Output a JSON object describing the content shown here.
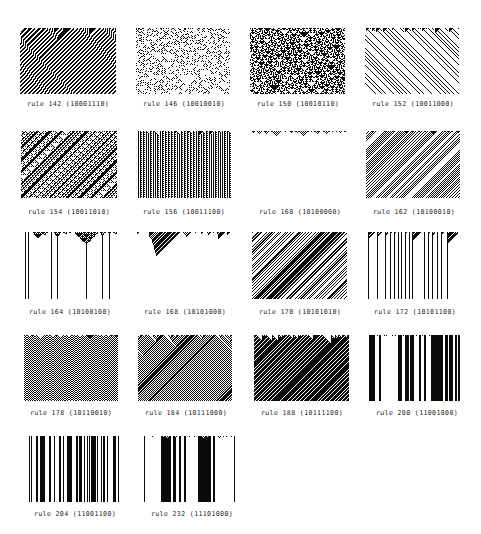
{
  "figure": {
    "panels": [
      {
        "rule": 142,
        "label": "rule 142 (10001110)",
        "style": "normal"
      },
      {
        "rule": 146,
        "label": "rule 146 (10010010)",
        "style": "sparse-chaos"
      },
      {
        "rule": 150,
        "label": "rule 150 (10010110)",
        "style": "normal"
      },
      {
        "rule": 152,
        "label": "rule 152 (10011000)",
        "style": "normal"
      },
      {
        "rule": 154,
        "label": "rule 154 (10011010)",
        "style": "normal"
      },
      {
        "rule": 156,
        "label": "rule 156 (10011100)",
        "style": "normal"
      },
      {
        "rule": 160,
        "label": "rule 160 (10100000)",
        "style": "normal"
      },
      {
        "rule": 162,
        "label": "rule 162 (10100010)",
        "style": "normal"
      },
      {
        "rule": 164,
        "label": "rule 164 (10100100)",
        "style": "normal"
      },
      {
        "rule": 168,
        "label": "rule 168 (10101000)",
        "style": "normal"
      },
      {
        "rule": 170,
        "label": "rule 170 (10101010)",
        "style": "normal"
      },
      {
        "rule": 172,
        "label": "rule 172 (10101100)",
        "style": "normal"
      },
      {
        "rule": 178,
        "label": "rule 178 (10110010)",
        "style": "normal"
      },
      {
        "rule": 184,
        "label": "rule 184 (10111000)",
        "style": "normal"
      },
      {
        "rule": 188,
        "label": "rule 188 (10111100)",
        "style": "normal"
      },
      {
        "rule": 200,
        "label": "rule 200 (11001000)",
        "style": "normal"
      },
      {
        "rule": 204,
        "label": "rule 204 (11001100)",
        "style": "normal"
      },
      {
        "rule": 232,
        "label": "rule 232 (11101000)",
        "style": "normal"
      }
    ]
  }
}
